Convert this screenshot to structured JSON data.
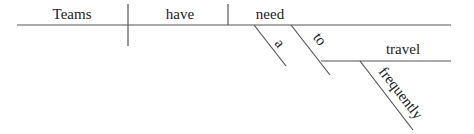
{
  "diagram": {
    "type": "sentence-diagram",
    "sentence": "Teams have a need to travel frequently",
    "line_color": "#555555",
    "text_color": "#222222",
    "words": {
      "subject": "Teams",
      "verb": "have",
      "object": "need",
      "article_modifier": "a",
      "infinitive_marker": "to",
      "infinitive_verb": "travel",
      "adverb_modifier": "frequently"
    }
  }
}
